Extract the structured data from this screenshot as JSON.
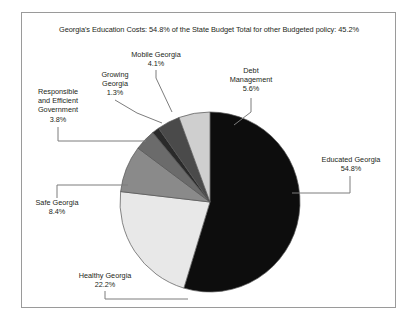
{
  "frame": {
    "border_color": "#9a9a9a"
  },
  "chart_data": {
    "type": "pie",
    "title": "Georgia's Education Costs: 54.8% of the State Budget Total for other Budgeted policy: 45.2%",
    "xlabel": "",
    "ylabel": "",
    "units": "percent",
    "total": 100.2,
    "legend_position": "none",
    "labels_outside": true,
    "categories": [
      "Educated Georgia",
      "Healthy Georgia",
      "Safe Georgia",
      "Responsible and Efficient Government",
      "Growing Georgia",
      "Mobile Georgia",
      "Debt Management"
    ],
    "values": [
      54.8,
      22.2,
      8.4,
      3.8,
      1.3,
      4.1,
      5.6
    ],
    "colors": [
      "#0d0d0d",
      "#e8e8e8",
      "#8a8a8a",
      "#6b6b6b",
      "#2a2a2a",
      "#4a4a4a",
      "#cfcfcf"
    ],
    "slice_edge_color": "#555555",
    "start_angle_deg": 0,
    "direction": "clockwise",
    "slices": [
      {
        "name": "Educated Georgia",
        "value": 54.8,
        "value_label": "54.8%",
        "color": "#0d0d0d"
      },
      {
        "name": "Healthy Georgia",
        "value": 22.2,
        "value_label": "22.2%",
        "color": "#e8e8e8"
      },
      {
        "name": "Safe Georgia",
        "value": 8.4,
        "value_label": "8.4%",
        "color": "#8a8a8a"
      },
      {
        "name": "Responsible and Efficient Government",
        "value": 3.8,
        "value_label": "3.8%",
        "color": "#6b6b6b"
      },
      {
        "name": "Growing Georgia",
        "value": 1.3,
        "value_label": "1.3%",
        "color": "#2a2a2a"
      },
      {
        "name": "Mobile Georgia",
        "value": 4.1,
        "value_label": "4.1%",
        "color": "#4a4a4a"
      },
      {
        "name": "Debt Management",
        "value": 5.6,
        "value_label": "5.6%",
        "color": "#cfcfcf"
      }
    ]
  },
  "labels": {
    "mobile": {
      "l1": "Mobile Georgia",
      "l2": "4.1%"
    },
    "debt": {
      "l1": "Debt",
      "l2": "Management",
      "l3": "5.6%"
    },
    "growing": {
      "l1": "Growing",
      "l2": "Georgia",
      "l3": "1.3%"
    },
    "responsible": {
      "l1": "Responsible",
      "l2": "and Efficient",
      "l3": "Government",
      "l4": "3.8%"
    },
    "safe": {
      "l1": "Safe Georgia",
      "l2": "8.4%"
    },
    "healthy": {
      "l1": "Healthy Georgia",
      "l2": "22.2%"
    },
    "educated": {
      "l1": "Educated Georgia",
      "l2": "54.8%"
    }
  }
}
